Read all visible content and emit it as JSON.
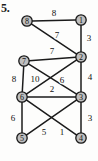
{
  "figure": {
    "problem_number": "5.",
    "caption": "",
    "node_fill_color": "#bfbfbf",
    "node_stroke_color": "#181818",
    "edge_color": "#1b1b1b",
    "background_color": "#fdfdfc"
  },
  "chart_data": {
    "type": "diagram",
    "title": "",
    "xlabel": "",
    "ylabel": "",
    "graph_type": "weighted-undirected-graph",
    "node_count": 8,
    "edge_count": 13,
    "nodes": [
      {
        "id": "8",
        "label": "8",
        "x": 27,
        "y": 21
      },
      {
        "id": "1",
        "label": "1",
        "x": 81,
        "y": 20
      },
      {
        "id": "7",
        "label": "7",
        "x": 24,
        "y": 61
      },
      {
        "id": "2",
        "label": "2",
        "x": 81,
        "y": 57
      },
      {
        "id": "6",
        "label": "6",
        "x": 22,
        "y": 97
      },
      {
        "id": "3",
        "label": "3",
        "x": 81,
        "y": 97
      },
      {
        "id": "5",
        "label": "5",
        "x": 22,
        "y": 138
      },
      {
        "id": "4",
        "label": "4",
        "x": 81,
        "y": 138
      }
    ],
    "edges": [
      {
        "from": "8",
        "to": "1",
        "weight": 8,
        "label": "8",
        "lx": 54,
        "ly": 13
      },
      {
        "from": "8",
        "to": "2",
        "weight": 7,
        "label": "7",
        "lx": 57,
        "ly": 35
      },
      {
        "from": "1",
        "to": "2",
        "weight": 3,
        "label": "3",
        "lx": 89,
        "ly": 38
      },
      {
        "from": "7",
        "to": "2",
        "weight": 7,
        "label": "7",
        "lx": 52,
        "ly": 51
      },
      {
        "from": "7",
        "to": "6",
        "weight": 8,
        "label": "8",
        "lx": 14,
        "ly": 79
      },
      {
        "from": "7",
        "to": "3",
        "weight": 10,
        "label": "10",
        "lx": 35,
        "ly": 79
      },
      {
        "from": "2",
        "to": "6",
        "weight": 6,
        "label": "6",
        "lx": 62,
        "ly": 80
      },
      {
        "from": "2",
        "to": "3",
        "weight": 4,
        "label": "4",
        "lx": 90,
        "ly": 77
      },
      {
        "from": "6",
        "to": "3",
        "weight": 2,
        "label": "2",
        "lx": 52,
        "ly": 89
      },
      {
        "from": "6",
        "to": "5",
        "weight": 6,
        "label": "6",
        "lx": 13,
        "ly": 118
      },
      {
        "from": "6",
        "to": "4",
        "weight": 1,
        "label": "1",
        "lx": 62,
        "ly": 132
      },
      {
        "from": "3",
        "to": "5",
        "weight": 5,
        "label": "5",
        "lx": 44,
        "ly": 132
      },
      {
        "from": "3",
        "to": "4",
        "weight": 3,
        "label": "3",
        "lx": 90,
        "ly": 118
      }
    ],
    "weights": [
      8,
      7,
      3,
      7,
      8,
      10,
      6,
      4,
      2,
      6,
      1,
      5,
      3
    ],
    "node_labels": [
      "8",
      "1",
      "7",
      "2",
      "6",
      "3",
      "5",
      "4"
    ]
  }
}
